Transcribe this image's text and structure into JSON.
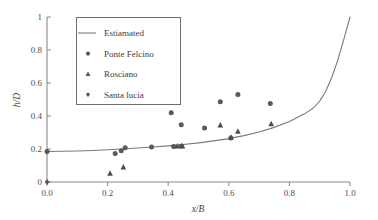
{
  "chart_data": {
    "type": "scatter",
    "title": "",
    "xlabel": "x/B",
    "ylabel": "h/D",
    "xlim": [
      0.0,
      1.0
    ],
    "ylim": [
      0.0,
      1.0
    ],
    "xticks": [
      "0.0",
      "0.2",
      "0.4",
      "0.6",
      "0.8",
      "1.0"
    ],
    "xtick_values": [
      0.0,
      0.2,
      0.4,
      0.6,
      0.8,
      1.0
    ],
    "yticks": [
      "0",
      "0.2",
      "0.4",
      "0.6",
      "0.8",
      "1"
    ],
    "ytick_values": [
      0.0,
      0.2,
      0.4,
      0.6,
      0.8,
      1.0
    ],
    "grid": false,
    "legend_position": "upper-left-inside",
    "series": [
      {
        "name": "Estiamated",
        "marker": "line",
        "color": "#7a7a7a",
        "x": [
          0.0,
          0.05,
          0.1,
          0.15,
          0.2,
          0.25,
          0.3,
          0.35,
          0.4,
          0.45,
          0.5,
          0.55,
          0.6,
          0.65,
          0.7,
          0.75,
          0.8,
          0.85,
          0.88,
          0.9,
          0.92,
          0.94,
          0.96,
          0.98,
          1.0
        ],
        "y": [
          0.185,
          0.186,
          0.188,
          0.191,
          0.195,
          0.2,
          0.206,
          0.212,
          0.219,
          0.227,
          0.237,
          0.249,
          0.263,
          0.281,
          0.303,
          0.331,
          0.366,
          0.413,
          0.45,
          0.49,
          0.55,
          0.635,
          0.74,
          0.868,
          1.0
        ]
      },
      {
        "name": "Ponte Felcino",
        "marker": "circle",
        "color": "#595959",
        "x": [
          0.0,
          0.225,
          0.245,
          0.258,
          0.345,
          0.418,
          0.443,
          0.41,
          0.443,
          0.52,
          0.572,
          0.607,
          0.63,
          0.737
        ],
        "y": [
          0.185,
          0.172,
          0.19,
          0.208,
          0.212,
          0.215,
          0.218,
          0.42,
          0.347,
          0.327,
          0.487,
          0.267,
          0.531,
          0.476
        ]
      },
      {
        "name": "Rosciano",
        "marker": "triangle",
        "color": "#4d4d4d",
        "x": [
          0.208,
          0.252,
          0.43,
          0.447,
          0.572,
          0.607,
          0.63,
          0.74
        ],
        "y": [
          0.052,
          0.09,
          0.217,
          0.217,
          0.345,
          0.27,
          0.307,
          0.353
        ]
      },
      {
        "name": "Santa lucia",
        "marker": "diamond",
        "color": "#595959",
        "x": [
          0.0,
          0.0
        ],
        "y": [
          0.185,
          0.0
        ]
      }
    ]
  },
  "legend": {
    "entries": [
      {
        "label": "Estiamated",
        "marker": "line"
      },
      {
        "label": "Ponte Felcino",
        "marker": "circle"
      },
      {
        "label": "Rosciano",
        "marker": "triangle"
      },
      {
        "label": "Santa lucia",
        "marker": "diamond"
      }
    ]
  },
  "colors": {
    "axis": "#8a8a8a",
    "curve": "#7a7a7a",
    "marker": "#595959",
    "text": "#3d3d3d",
    "legend_border": "#6e6e6e",
    "background": "#ffffff"
  }
}
